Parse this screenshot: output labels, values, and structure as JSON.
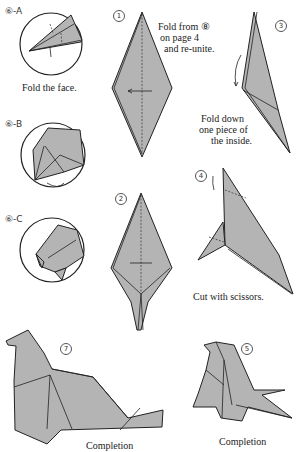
{
  "steps": {
    "a": {
      "label": "⑥-A",
      "caption": "Fold the face."
    },
    "b": {
      "label": "⑥-B"
    },
    "c": {
      "label": "⑥-C"
    },
    "s1": {
      "number": "1",
      "caption": [
        "Fold from ⑧",
        "on page 4",
        "and re-unite."
      ]
    },
    "s2": {
      "number": "2"
    },
    "s3": {
      "number": "3",
      "caption": [
        "Fold down",
        "one piece of",
        "the inside."
      ]
    },
    "s4": {
      "number": "4",
      "caption": "Cut with scissors."
    },
    "s5": {
      "number": "5",
      "caption": "Completion"
    },
    "s7": {
      "number": "7",
      "caption": "Completion"
    }
  },
  "colors": {
    "paper": "#b4b4b4",
    "line": "#222222"
  }
}
